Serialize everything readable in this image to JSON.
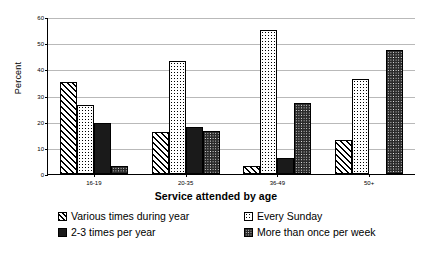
{
  "chart_data": {
    "type": "bar",
    "title": "",
    "xlabel": "Service attended by age",
    "ylabel": "Percent",
    "ylim": [
      0,
      60
    ],
    "yticks": [
      0,
      10,
      20,
      30,
      40,
      50,
      60
    ],
    "grid": true,
    "legend_position": "bottom",
    "categories": [
      "16-19",
      "20-35",
      "36-49",
      "50+"
    ],
    "series": [
      {
        "name": "Various times during year",
        "pattern": "diagonal-hatch",
        "values": [
          35,
          16,
          3,
          13
        ]
      },
      {
        "name": "Every Sunday",
        "pattern": "light-dots",
        "values": [
          26.5,
          43,
          55,
          36.5
        ]
      },
      {
        "name": "2-3 times per year",
        "pattern": "solid-black",
        "values": [
          19.5,
          18,
          6,
          0
        ]
      },
      {
        "name": "More than once per week",
        "pattern": "dark-dots",
        "values": [
          3,
          16.5,
          27,
          47.5
        ]
      }
    ]
  }
}
